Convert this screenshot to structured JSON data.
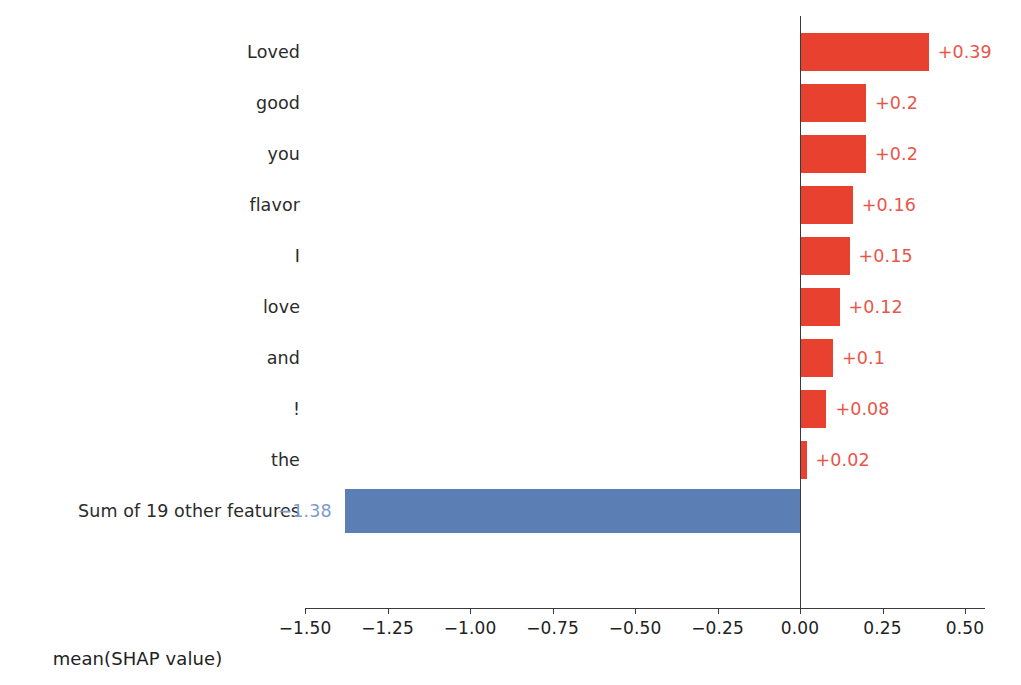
{
  "page": {
    "cropped_header_sliver": "",
    "background_color": "#ffffff"
  },
  "colors": {
    "positive_bar": "#e8412f",
    "negative_bar": "#5b7fb5",
    "positive_label_text": "#e8564a",
    "negative_label_text": "#7b9cc9",
    "axis": "#3a3a3a",
    "tick_text": "#222222",
    "category_text": "#2b2b2b"
  },
  "chart_data": {
    "type": "bar",
    "orientation": "horizontal",
    "title": "",
    "subtitle": "",
    "xlabel": "mean(SHAP value)",
    "ylabel": "",
    "xlim": [
      -1.62,
      0.58
    ],
    "ylim": [],
    "grid": false,
    "legend": null,
    "zero_reference_line": 0.0,
    "categories": [
      "Loved",
      "good",
      "you",
      "flavor",
      "I",
      "love",
      "and",
      "!",
      "the",
      "Sum of 19 other features"
    ],
    "values": [
      0.39,
      0.2,
      0.2,
      0.16,
      0.15,
      0.12,
      0.1,
      0.08,
      0.02,
      -1.38
    ],
    "data_labels": [
      "+0.39",
      "+0.2",
      "+0.2",
      "+0.16",
      "+0.15",
      "+0.12",
      "+0.1",
      "+0.08",
      "+0.02",
      "−1.38"
    ],
    "xticks": [
      -1.5,
      -1.25,
      -1.0,
      -0.75,
      -0.5,
      -0.25,
      0.0,
      0.25,
      0.5
    ],
    "xtick_labels": [
      "−1.50",
      "−1.25",
      "−1.00",
      "−0.75",
      "−0.50",
      "−0.25",
      "0.00",
      "0.25",
      "0.50"
    ]
  },
  "rows": [
    {
      "label": "Loved",
      "value_label": "+0.39",
      "sign": "positive"
    },
    {
      "label": "good",
      "value_label": "+0.2",
      "sign": "positive"
    },
    {
      "label": "you",
      "value_label": "+0.2",
      "sign": "positive"
    },
    {
      "label": "flavor",
      "value_label": "+0.16",
      "sign": "positive"
    },
    {
      "label": "I",
      "value_label": "+0.15",
      "sign": "positive"
    },
    {
      "label": "love",
      "value_label": "+0.12",
      "sign": "positive"
    },
    {
      "label": "and",
      "value_label": "+0.1",
      "sign": "positive"
    },
    {
      "label": "!",
      "value_label": "+0.08",
      "sign": "positive"
    },
    {
      "label": "the",
      "value_label": "+0.02",
      "sign": "positive"
    },
    {
      "label": "Sum of 19 other features",
      "value_label": "−1.38",
      "sign": "negative"
    }
  ],
  "axis": {
    "title": "mean(SHAP value)",
    "tick_labels": [
      "−1.50",
      "−1.25",
      "−1.00",
      "−0.75",
      "−0.50",
      "−0.25",
      "0.00",
      "0.25",
      "0.50"
    ]
  }
}
